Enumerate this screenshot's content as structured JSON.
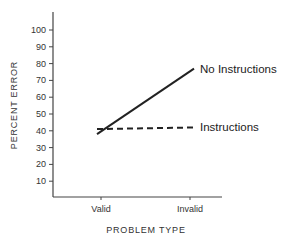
{
  "chart_data": {
    "type": "line",
    "title": "",
    "xlabel": "PROBLEM TYPE",
    "ylabel": "PERCENT ERROR",
    "categories": [
      "Valid",
      "Invalid"
    ],
    "series": [
      {
        "name": "No Instructions",
        "values": [
          38,
          77
        ],
        "style": "solid"
      },
      {
        "name": "Instructions",
        "values": [
          41,
          42
        ],
        "style": "dashed"
      }
    ],
    "yticks": [
      10,
      20,
      30,
      40,
      50,
      60,
      70,
      80,
      90,
      100
    ],
    "ylim": [
      0,
      110
    ],
    "grid": false,
    "legend": "inline labels at line ends",
    "colors": {
      "line": "#222222",
      "axis": "#444444",
      "background": "#ffffff"
    }
  }
}
